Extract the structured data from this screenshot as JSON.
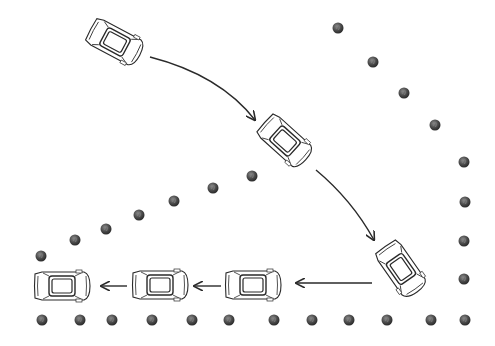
{
  "diagram": {
    "colors": {
      "background": "#ffffff",
      "ink": "#2a2a2a",
      "ball_dark": "#3a3a3a",
      "ball_mid": "#7a7a7a",
      "car_body": "#ffffff"
    },
    "markers": {
      "diagonal_row": {
        "count": 7,
        "icon": "ball-marker-icon"
      },
      "right_curve": {
        "count": 8,
        "icon": "ball-marker-icon"
      },
      "bottom_row": {
        "count": 12,
        "icon": "ball-marker-icon"
      }
    },
    "cars": [
      {
        "id": "car-1",
        "icon": "car-icon",
        "step": 1
      },
      {
        "id": "car-2",
        "icon": "car-icon",
        "step": 2
      },
      {
        "id": "car-3",
        "icon": "car-icon",
        "step": 3
      },
      {
        "id": "car-4",
        "icon": "car-icon",
        "step": 4
      },
      {
        "id": "car-5",
        "icon": "car-icon",
        "step": 5
      },
      {
        "id": "car-6",
        "icon": "car-icon",
        "step": 6
      }
    ],
    "arrows": [
      {
        "from": "car-1",
        "to": "car-2",
        "style": "curved"
      },
      {
        "from": "car-2",
        "to": "car-3",
        "style": "curved"
      },
      {
        "from": "car-3",
        "to": "car-4",
        "style": "straight"
      },
      {
        "from": "car-4",
        "to": "car-5",
        "style": "straight"
      },
      {
        "from": "car-5",
        "to": "car-6",
        "style": "straight"
      }
    ]
  }
}
